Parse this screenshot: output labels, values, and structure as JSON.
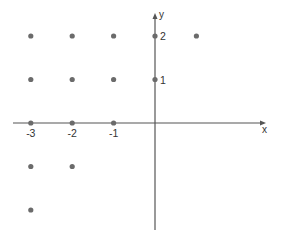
{
  "chart_data": {
    "type": "scatter",
    "title": "",
    "xlabel": "x",
    "ylabel": "y",
    "xlim": [
      -3.4,
      2.7
    ],
    "ylim": [
      -2.5,
      2.5
    ],
    "grid": false,
    "legend": null,
    "x_tick_labels": [
      {
        "value": -3,
        "label": "-3"
      },
      {
        "value": -2,
        "label": "-2"
      },
      {
        "value": -1,
        "label": "-1"
      }
    ],
    "y_tick_labels": [
      {
        "value": 2,
        "label": "2"
      },
      {
        "value": 1,
        "label": "1"
      }
    ],
    "points": [
      {
        "x": -3,
        "y": 2
      },
      {
        "x": -2,
        "y": 2
      },
      {
        "x": -1,
        "y": 2
      },
      {
        "x": 0,
        "y": 2
      },
      {
        "x": 1,
        "y": 2
      },
      {
        "x": -3,
        "y": 1
      },
      {
        "x": -2,
        "y": 1
      },
      {
        "x": -1,
        "y": 1
      },
      {
        "x": 0,
        "y": 1
      },
      {
        "x": -3,
        "y": 0
      },
      {
        "x": -2,
        "y": 0
      },
      {
        "x": -1,
        "y": 0
      },
      {
        "x": -3,
        "y": -1
      },
      {
        "x": -2,
        "y": -1
      },
      {
        "x": -3,
        "y": -2
      }
    ]
  },
  "style": {
    "axis_color": "#555555",
    "point_color": "#6b6b6b",
    "text_color": "#333333"
  },
  "layout": {
    "origin_px": [
      155,
      123
    ],
    "x_unit_px": 41.4,
    "y_unit_px": 43.5,
    "x_axis_range_px": [
      13,
      266
    ],
    "y_axis_range_px": [
      230,
      13
    ],
    "point_radius": 2.6
  }
}
